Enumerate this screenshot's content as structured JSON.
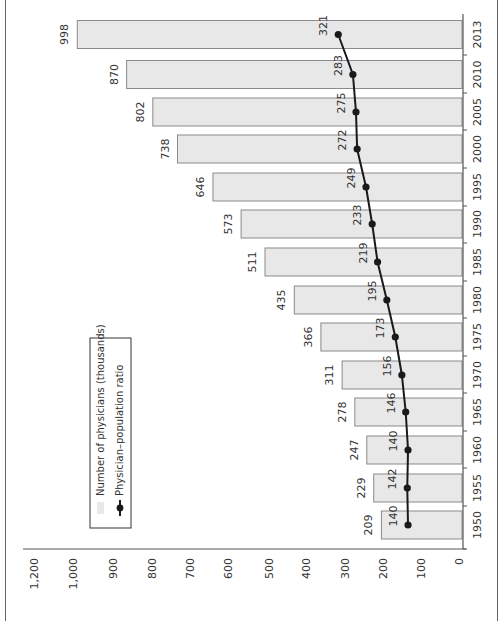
{
  "chart_data": {
    "type": "bar",
    "orientation": "rotated 90° clockwise (x-axis on right running top-to-bottom, values increase leftward)",
    "title": "",
    "xlabel": "",
    "ylabel": "",
    "categories": [
      "1950",
      "1955",
      "1960",
      "1965",
      "1970",
      "1975",
      "1980",
      "1985",
      "1990",
      "1995",
      "2000",
      "2005",
      "2010",
      "2013"
    ],
    "series": [
      {
        "name": "Number of physicians (thousands)",
        "kind": "bar",
        "color": "#e8e8e8",
        "values": [
          209,
          229,
          247,
          278,
          311,
          366,
          435,
          511,
          573,
          646,
          738,
          802,
          870,
          998
        ]
      },
      {
        "name": "Physician–population ratio",
        "kind": "line",
        "marker": "circle",
        "color": "#1a1a1a",
        "values": [
          140,
          142,
          140,
          146,
          156,
          173,
          195,
          219,
          233,
          249,
          272,
          275,
          283,
          321
        ]
      }
    ],
    "y_ticks": [
      "0",
      "100",
      "200",
      "300",
      "400",
      "500",
      "600",
      "700",
      "800",
      "900",
      "1,000",
      "1,200"
    ],
    "ylim": [
      0,
      1200
    ],
    "grid": false,
    "legend": {
      "position": "inside, upper-left region (rotated)",
      "entries": [
        "Number of physicians (thousands)",
        "Physician–population ratio"
      ]
    },
    "data_labels": true
  }
}
